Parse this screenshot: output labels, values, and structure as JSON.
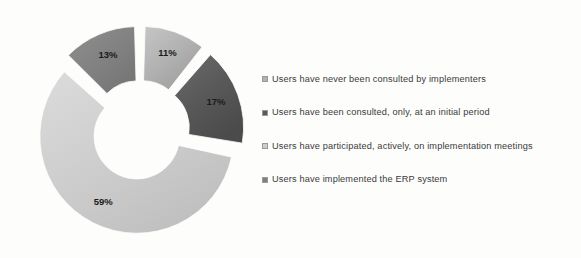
{
  "chart_data": {
    "type": "pie",
    "variant": "exploded-doughnut",
    "title": "",
    "subtitle": "",
    "xlabel": "",
    "ylabel": "",
    "grid": false,
    "legend_position": "right",
    "hole_ratio": 0.44,
    "start_angle_deg": 0,
    "explode_px": 7,
    "categories": [
      "Users have never been consulted by implementers",
      "Users have been consulted, only, at an initial period",
      "Users have participated, actively, on implementation meetings",
      "Users have implemented the ERP system"
    ],
    "values": [
      11,
      17,
      59,
      13
    ],
    "value_labels": [
      "11%",
      "17%",
      "59%",
      "13%"
    ],
    "colors": [
      "#b3b3b3",
      "#595959",
      "#cdcdcd",
      "#808080"
    ],
    "slices": [
      {
        "label": "11%",
        "value": 11,
        "color": "#b3b3b3",
        "name": "Users have never been consulted by implementers"
      },
      {
        "label": "17%",
        "value": 17,
        "color": "#595959",
        "name": "Users have been consulted, only, at an initial period"
      },
      {
        "label": "59%",
        "value": 59,
        "color": "#cdcdcd",
        "name": "Users have participated, actively, on implementation meetings"
      },
      {
        "label": "13%",
        "value": 13,
        "color": "#808080",
        "name": "Users have implemented the ERP system"
      }
    ]
  },
  "legend": {
    "items": [
      {
        "label": "Users have never been consulted by implementers",
        "color": "#b3b3b3"
      },
      {
        "label": "Users have been consulted, only, at an initial period",
        "color": "#595959"
      },
      {
        "label": "Users have participated, actively, on implementation meetings",
        "color": "#cdcdcd"
      },
      {
        "label": "Users have implemented the ERP system",
        "color": "#808080"
      }
    ]
  },
  "canvas": {
    "background": "#fdfdfc"
  }
}
